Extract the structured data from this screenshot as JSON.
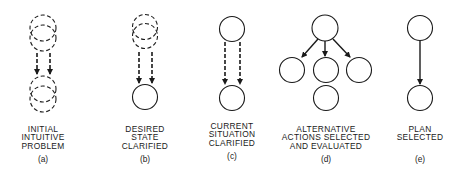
{
  "diagram": {
    "stroke_color": "#1a1a1a",
    "panels": [
      {
        "id": "a",
        "tag": "(a)",
        "label_lines": [
          "INITIAL",
          "INTUITIVE",
          "PROBLEM"
        ],
        "nodes": [
          {
            "cx": 43,
            "cy": 28,
            "r": 13,
            "style": "dashed"
          },
          {
            "cx": 43,
            "cy": 38,
            "r": 13,
            "style": "dashed"
          },
          {
            "cx": 43,
            "cy": 89,
            "r": 13,
            "style": "dashed"
          },
          {
            "cx": 43,
            "cy": 99,
            "r": 13,
            "style": "dashed"
          }
        ],
        "arrows": [
          {
            "x1": 37,
            "y1": 53,
            "x2": 37,
            "y2": 74,
            "style": "dashed"
          },
          {
            "x1": 50,
            "y1": 53,
            "x2": 50,
            "y2": 74,
            "style": "dashed"
          }
        ]
      },
      {
        "id": "b",
        "tag": "(b)",
        "label_lines": [
          "DESIRED",
          "STATE",
          "CLARIFIED"
        ],
        "nodes": [
          {
            "cx": 145,
            "cy": 27,
            "r": 12.5,
            "style": "dashed"
          },
          {
            "cx": 145,
            "cy": 36,
            "r": 12.5,
            "style": "dashed"
          },
          {
            "cx": 145,
            "cy": 97,
            "r": 12.5,
            "style": "solid"
          }
        ],
        "arrows": [
          {
            "x1": 139,
            "y1": 52,
            "x2": 139,
            "y2": 83,
            "style": "dashed"
          },
          {
            "x1": 152,
            "y1": 52,
            "x2": 152,
            "y2": 83,
            "style": "dashed"
          }
        ]
      },
      {
        "id": "c",
        "tag": "(c)",
        "label_lines": [
          "CURRENT",
          "SITUATION",
          "CLARIFIED"
        ],
        "nodes": [
          {
            "cx": 232,
            "cy": 29,
            "r": 12.5,
            "style": "solid"
          },
          {
            "cx": 232,
            "cy": 98,
            "r": 12.5,
            "style": "solid"
          }
        ],
        "arrows": [
          {
            "x1": 225,
            "y1": 42,
            "x2": 225,
            "y2": 84,
            "style": "dashed"
          },
          {
            "x1": 240,
            "y1": 42,
            "x2": 240,
            "y2": 84,
            "style": "dashed"
          }
        ]
      },
      {
        "id": "d",
        "tag": "(d)",
        "label_lines": [
          "ALTERNATIVE",
          "ACTIONS SELECTED",
          "AND EVALUATED"
        ],
        "nodes": [
          {
            "cx": 325,
            "cy": 28,
            "r": 13,
            "style": "solid"
          },
          {
            "cx": 292,
            "cy": 70,
            "r": 12.5,
            "style": "solid"
          },
          {
            "cx": 326,
            "cy": 70,
            "r": 12.5,
            "style": "solid"
          },
          {
            "cx": 359,
            "cy": 70,
            "r": 12.5,
            "style": "solid"
          },
          {
            "cx": 326,
            "cy": 98,
            "r": 12.5,
            "style": "solid"
          }
        ],
        "arrows": [
          {
            "x1": 318,
            "y1": 39,
            "x2": 302,
            "y2": 57,
            "style": "solid"
          },
          {
            "x1": 325,
            "y1": 41,
            "x2": 325,
            "y2": 56,
            "style": "solid"
          },
          {
            "x1": 333,
            "y1": 39,
            "x2": 350,
            "y2": 57,
            "style": "solid"
          }
        ]
      },
      {
        "id": "e",
        "tag": "(e)",
        "label_lines": [
          "PLAN",
          "SELECTED"
        ],
        "nodes": [
          {
            "cx": 420,
            "cy": 28,
            "r": 12.5,
            "style": "solid"
          },
          {
            "cx": 420,
            "cy": 98,
            "r": 12.5,
            "style": "solid"
          }
        ],
        "arrows": [
          {
            "x1": 420,
            "y1": 41,
            "x2": 420,
            "y2": 84,
            "style": "solid"
          }
        ]
      }
    ]
  }
}
